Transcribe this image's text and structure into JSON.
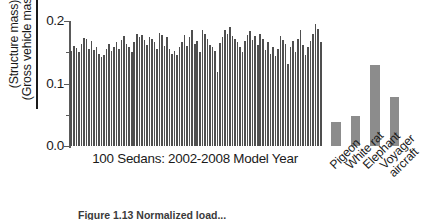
{
  "figure": {
    "caption": "Figure 1.13  Normalized load...",
    "axis_color": "#5a5a5a",
    "sedan_bar_color": "#4f4f4f",
    "reference_bar_color": "#8c8c8c"
  },
  "yaxis": {
    "label_numerator": "(Structure mass)",
    "label_denominator": "(Gross vehicle mass)",
    "ticks": [
      "0.2",
      "0.1",
      "0.0"
    ]
  },
  "xaxis": {
    "label": "100 Sedans: 2002-2008 Model Year"
  },
  "chart_data": {
    "type": "bar",
    "title": "",
    "xlabel": "100 Sedans: 2002-2008 Model Year",
    "ylabel": "(Structure mass) / (Gross vehicle mass)",
    "ylim": [
      0.0,
      0.2
    ],
    "yticks": [
      0.0,
      0.1,
      0.2
    ],
    "grid": false,
    "legend": "none",
    "series": [
      {
        "name": "100 Sedans: 2002-2008 Model Year",
        "color": "#4f4f4f",
        "categories": [
          "S1",
          "S2",
          "S3",
          "S4",
          "S5",
          "S6",
          "S7",
          "S8",
          "S9",
          "S10",
          "S11",
          "S12",
          "S13",
          "S14",
          "S15",
          "S16",
          "S17",
          "S18",
          "S19",
          "S20",
          "S21",
          "S22",
          "S23",
          "S24",
          "S25",
          "S26",
          "S27",
          "S28",
          "S29",
          "S30",
          "S31",
          "S32",
          "S33",
          "S34",
          "S35",
          "S36",
          "S37",
          "S38",
          "S39",
          "S40",
          "S41",
          "S42",
          "S43",
          "S44",
          "S45",
          "S46",
          "S47",
          "S48",
          "S49",
          "S50",
          "S51",
          "S52",
          "S53",
          "S54",
          "S55",
          "S56",
          "S57",
          "S58",
          "S59",
          "S60",
          "S61",
          "S62",
          "S63",
          "S64",
          "S65",
          "S66",
          "S67",
          "S68",
          "S69",
          "S70",
          "S71",
          "S72",
          "S73",
          "S74",
          "S75",
          "S76",
          "S77",
          "S78",
          "S79",
          "S80",
          "S81",
          "S82",
          "S83",
          "S84",
          "S85",
          "S86",
          "S87",
          "S88",
          "S89",
          "S90",
          "S91",
          "S92",
          "S93",
          "S94",
          "S95",
          "S96",
          "S97",
          "S98",
          "S99",
          "S100"
        ],
        "values": [
          0.152,
          0.16,
          0.157,
          0.15,
          0.163,
          0.173,
          0.172,
          0.156,
          0.168,
          0.154,
          0.159,
          0.148,
          0.142,
          0.146,
          0.155,
          0.163,
          0.152,
          0.159,
          0.166,
          0.155,
          0.169,
          0.176,
          0.164,
          0.158,
          0.15,
          0.167,
          0.18,
          0.175,
          0.178,
          0.169,
          0.162,
          0.174,
          0.171,
          0.166,
          0.155,
          0.181,
          0.178,
          0.16,
          0.174,
          0.156,
          0.148,
          0.152,
          0.145,
          0.158,
          0.166,
          0.178,
          0.16,
          0.175,
          0.185,
          0.163,
          0.168,
          0.15,
          0.186,
          0.18,
          0.171,
          0.162,
          0.158,
          0.152,
          0.118,
          0.165,
          0.174,
          0.186,
          0.18,
          0.19,
          0.176,
          0.172,
          0.166,
          0.158,
          0.15,
          0.168,
          0.178,
          0.184,
          0.17,
          0.176,
          0.162,
          0.18,
          0.172,
          0.154,
          0.166,
          0.148,
          0.158,
          0.144,
          0.156,
          0.176,
          0.17,
          0.164,
          0.132,
          0.158,
          0.168,
          0.15,
          0.172,
          0.186,
          0.162,
          0.146,
          0.158,
          0.168,
          0.18,
          0.196,
          0.188,
          0.166
        ]
      },
      {
        "name": "Biological and aircraft references",
        "color": "#8c8c8c",
        "categories": [
          "Pigeon",
          "White rat",
          "Elephant",
          "Voyager aircraft"
        ],
        "values": [
          0.039,
          0.048,
          0.129,
          0.079
        ]
      }
    ]
  },
  "category_labels": [
    {
      "name": "Pigeon"
    },
    {
      "name": "White rat"
    },
    {
      "name": "Elephant"
    },
    {
      "name": "Voyager"
    },
    {
      "name": "aircraft"
    }
  ]
}
